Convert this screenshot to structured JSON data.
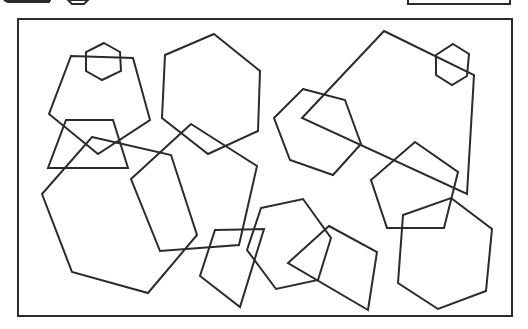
{
  "canvas": {
    "width": 528,
    "height": 329,
    "background": "#ffffff",
    "stroke": "#2b2b2b"
  },
  "partial_elements": [
    {
      "name": "clipped-dark-button",
      "points": [
        [
          4,
          0
        ],
        [
          50,
          0
        ],
        [
          49,
          2
        ],
        [
          8,
          2
        ]
      ],
      "fill": "#222222"
    },
    {
      "name": "clipped-hexagon-icon",
      "points": [
        [
          68,
          0
        ],
        [
          88,
          0
        ],
        [
          84,
          4
        ],
        [
          72,
          4
        ]
      ]
    },
    {
      "name": "clipped-rectangle-box",
      "x": 408,
      "y": -10,
      "width": 102,
      "height": 14
    }
  ],
  "frame": {
    "x": 18,
    "y": 19,
    "width": 494,
    "height": 297
  },
  "shapes": [
    {
      "name": "hexagon-small-top-left",
      "points": [
        [
          104,
          43
        ],
        [
          120,
          52
        ],
        [
          121,
          71
        ],
        [
          102,
          80
        ],
        [
          86,
          71
        ],
        [
          86,
          52
        ]
      ]
    },
    {
      "name": "pentagon-top-left",
      "points": [
        [
          71,
          56
        ],
        [
          133,
          58
        ],
        [
          150,
          120
        ],
        [
          98,
          154
        ],
        [
          49,
          114
        ]
      ]
    },
    {
      "name": "trapezoid-left",
      "points": [
        [
          66,
          120
        ],
        [
          113,
          120
        ],
        [
          128,
          168
        ],
        [
          48,
          168
        ]
      ]
    },
    {
      "name": "hexagon-large-left",
      "points": [
        [
          92,
          137
        ],
        [
          171,
          155
        ],
        [
          197,
          235
        ],
        [
          148,
          293
        ],
        [
          72,
          272
        ],
        [
          42,
          194
        ]
      ]
    },
    {
      "name": "hexagon-top-center",
      "points": [
        [
          214,
          34
        ],
        [
          260,
          71
        ],
        [
          258,
          131
        ],
        [
          208,
          154
        ],
        [
          162,
          118
        ],
        [
          165,
          55
        ]
      ]
    },
    {
      "name": "pentagon-center",
      "points": [
        [
          191,
          124
        ],
        [
          257,
          166
        ],
        [
          239,
          245
        ],
        [
          160,
          251
        ],
        [
          131,
          179
        ]
      ]
    },
    {
      "name": "quad-bottom-center",
      "points": [
        [
          215,
          230
        ],
        [
          264,
          229
        ],
        [
          240,
          307
        ],
        [
          200,
          276
        ]
      ]
    },
    {
      "name": "hexagon-bottom-center",
      "points": [
        [
          261,
          208
        ],
        [
          303,
          199
        ],
        [
          331,
          238
        ],
        [
          318,
          280
        ],
        [
          276,
          289
        ],
        [
          247,
          250
        ]
      ]
    },
    {
      "name": "quad-bottom-center-right",
      "points": [
        [
          329,
          226
        ],
        [
          377,
          252
        ],
        [
          368,
          310
        ],
        [
          288,
          263
        ]
      ]
    },
    {
      "name": "hexagon-mid-right",
      "points": [
        [
          303,
          89
        ],
        [
          345,
          100
        ],
        [
          361,
          144
        ],
        [
          333,
          175
        ],
        [
          290,
          160
        ],
        [
          274,
          118
        ]
      ]
    },
    {
      "name": "quad-large-top-right",
      "points": [
        [
          384,
          31
        ],
        [
          474,
          75
        ],
        [
          467,
          194
        ],
        [
          302,
          118
        ]
      ]
    },
    {
      "name": "hexagon-small-top-right",
      "points": [
        [
          453,
          44
        ],
        [
          469,
          54
        ],
        [
          467,
          76
        ],
        [
          452,
          85
        ],
        [
          436,
          75
        ],
        [
          436,
          55
        ]
      ]
    },
    {
      "name": "pentagon-right",
      "points": [
        [
          415,
          142
        ],
        [
          458,
          172
        ],
        [
          444,
          228
        ],
        [
          387,
          228
        ],
        [
          371,
          180
        ]
      ]
    },
    {
      "name": "hexagon-bottom-right",
      "points": [
        [
          451,
          198
        ],
        [
          492,
          229
        ],
        [
          486,
          291
        ],
        [
          438,
          309
        ],
        [
          398,
          283
        ],
        [
          403,
          215
        ]
      ]
    }
  ]
}
